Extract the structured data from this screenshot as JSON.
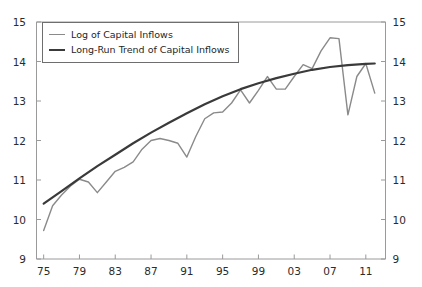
{
  "chart_data": {
    "type": "line",
    "title": "",
    "xlabel": "",
    "ylabel": "",
    "xlim": [
      1974.2,
      2013.2
    ],
    "ylim": [
      9,
      15
    ],
    "grid": false,
    "legend_position": "top-left",
    "y_ticks": [
      "9",
      "10",
      "11",
      "12",
      "13",
      "14",
      "15"
    ],
    "y_ticks_right": [
      "9",
      "10",
      "11",
      "12",
      "13",
      "14",
      "15"
    ],
    "x_ticks": [
      "75",
      "79",
      "83",
      "87",
      "91",
      "95",
      "99",
      "03",
      "07",
      "11"
    ],
    "x_tick_years": [
      1975,
      1979,
      1983,
      1987,
      1991,
      1995,
      1999,
      2003,
      2007,
      2011
    ],
    "series": [
      {
        "name": "Log of Capital Inflows",
        "color": "#8a8a8a",
        "width": 1.4,
        "x": [
          1975,
          1976,
          1977,
          1978,
          1979,
          1980,
          1981,
          1982,
          1983,
          1984,
          1985,
          1986,
          1987,
          1988,
          1989,
          1990,
          1991,
          1992,
          1993,
          1994,
          1995,
          1996,
          1997,
          1998,
          1999,
          2000,
          2001,
          2002,
          2003,
          2004,
          2005,
          2006,
          2007,
          2008,
          2009,
          2010,
          2011,
          2012
        ],
        "values": [
          9.72,
          10.35,
          10.62,
          10.85,
          11.02,
          10.95,
          10.68,
          10.95,
          11.22,
          11.32,
          11.46,
          11.78,
          12.0,
          12.05,
          12.0,
          11.93,
          11.58,
          12.1,
          12.55,
          12.7,
          12.72,
          12.95,
          13.28,
          12.95,
          13.27,
          13.62,
          13.3,
          13.3,
          13.62,
          13.92,
          13.82,
          14.27,
          14.6,
          14.58,
          12.65,
          13.62,
          13.95,
          13.2
        ]
      },
      {
        "name": "Long-Run Trend of Capital Inflows",
        "color": "#3a3a3a",
        "width": 2.2,
        "x": [
          1975,
          1977,
          1979,
          1981,
          1983,
          1985,
          1987,
          1989,
          1991,
          1993,
          1995,
          1997,
          1999,
          2001,
          2003,
          2005,
          2007,
          2009,
          2011,
          2012
        ],
        "values": [
          10.4,
          10.72,
          11.04,
          11.35,
          11.64,
          11.93,
          12.2,
          12.45,
          12.69,
          12.92,
          13.12,
          13.3,
          13.45,
          13.58,
          13.69,
          13.79,
          13.86,
          13.91,
          13.94,
          13.95
        ]
      }
    ],
    "legend": [
      {
        "label": "Log of Capital Inflows",
        "style": "thin"
      },
      {
        "label": "Long-Run Trend of Capital Inflows",
        "style": "thick"
      }
    ]
  }
}
